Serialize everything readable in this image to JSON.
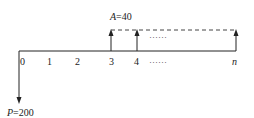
{
  "diagram": {
    "type": "cash-flow-diagram",
    "axis": {
      "ticks": [
        "0",
        "1",
        "2",
        "3",
        "4",
        "n"
      ],
      "ellipsis": "……"
    },
    "outflow": {
      "label": "P=200",
      "period": "0",
      "value": 200,
      "direction": "down"
    },
    "inflow": {
      "label": "A=40",
      "value": 40,
      "start_period": "3",
      "end_period": "n",
      "direction": "up",
      "ellipsis": "……"
    },
    "colors": {
      "line": "#222222",
      "dashed": "#444444"
    }
  }
}
